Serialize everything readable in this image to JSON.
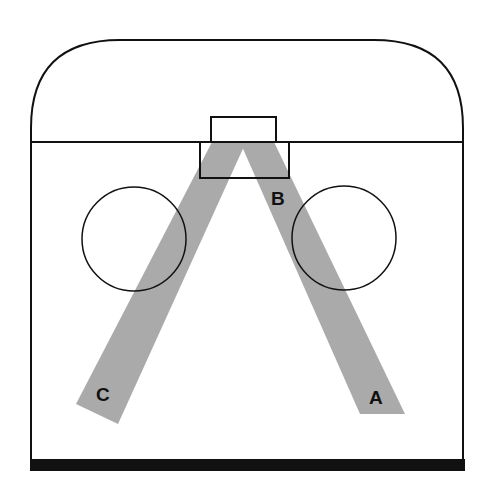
{
  "diagram": {
    "title": "",
    "colors": {
      "outline": "#111111",
      "beam": "#aaaaaa",
      "background": "#ffffff",
      "floor": "#111111"
    },
    "labels": {
      "a": "A",
      "b": "B",
      "c": "C"
    },
    "elements": {
      "enclosure": "rounded-top enclosure with horizontal divider",
      "source_upper_box": "upper source box above divider",
      "source_lower_box": "lower source box below divider",
      "beam_left": "beam toward C",
      "beam_right": "beam toward A",
      "circle_left": "left circle",
      "circle_right": "right circle",
      "floor": "thick floor bar"
    }
  }
}
